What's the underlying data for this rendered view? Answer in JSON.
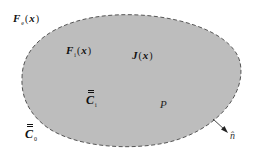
{
  "diagram": {
    "region": {
      "fill": "#bdbdbd",
      "stroke": "#555555",
      "stroke_style": "dashed"
    },
    "labels": {
      "exterior_field": {
        "symbol": "F",
        "subscript": "e",
        "argument": "x"
      },
      "interior_field": {
        "symbol": "F",
        "subscript": "i",
        "argument": "x"
      },
      "current": {
        "symbol": "J",
        "argument": "x"
      },
      "interior_tensor": {
        "symbol": "C",
        "subscript": "i"
      },
      "exterior_tensor": {
        "symbol": "C",
        "subscript": "0"
      },
      "point": {
        "symbol": "P"
      },
      "normal": {
        "symbol": "n̂"
      }
    },
    "paren_open": "(",
    "paren_close": ")"
  }
}
